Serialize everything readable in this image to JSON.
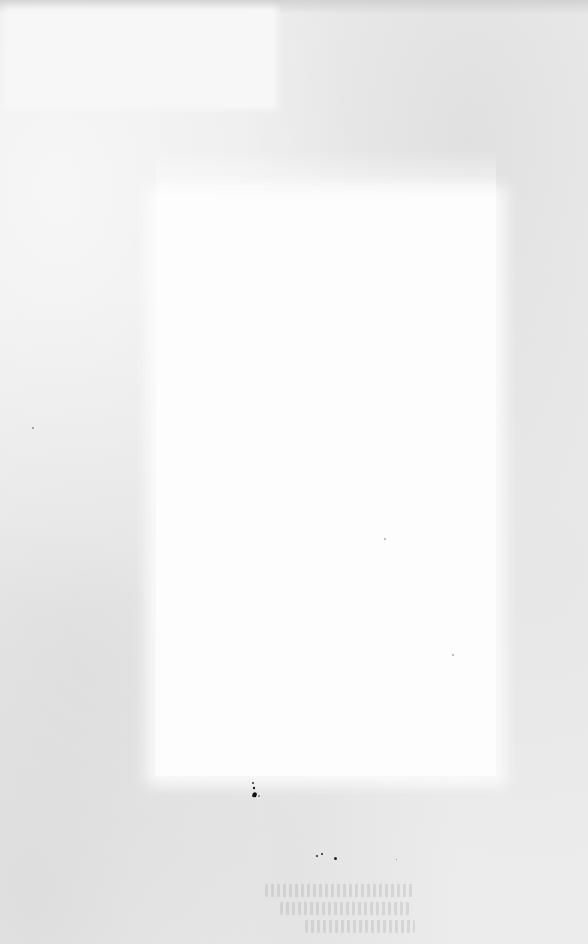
{
  "document": {
    "type": "scanned-page",
    "content": "",
    "note_visible_text": [],
    "colors": {
      "paper": "#ececec",
      "blank_region": "#fdfdfd",
      "ink": "#222222"
    }
  },
  "regions": {
    "corner_patch": {
      "label": ""
    },
    "central_blank_area": {
      "label": ""
    },
    "bottom_faint_text": {
      "lines": [
        "",
        "",
        ""
      ]
    }
  }
}
